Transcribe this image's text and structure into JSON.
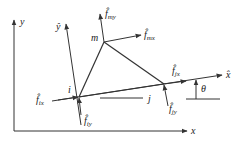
{
  "diagram": {
    "type": "triangular-element-force-diagram",
    "global_axes": {
      "x_label": "x",
      "y_label": "y"
    },
    "local_axes": {
      "x_label": "x̂",
      "y_label": "ŷ"
    },
    "nodes": [
      {
        "id": "i",
        "label": "i"
      },
      {
        "id": "j",
        "label": "j"
      },
      {
        "id": "m",
        "label": "m"
      }
    ],
    "forces": [
      {
        "name": "f_ix",
        "base": "f̂",
        "sub": "ix"
      },
      {
        "name": "f_iy",
        "base": "f̂",
        "sub": "iy"
      },
      {
        "name": "f_jx",
        "base": "f̂",
        "sub": "jx"
      },
      {
        "name": "f_jy",
        "base": "f̂",
        "sub": "jy"
      },
      {
        "name": "f_mx",
        "base": "f̂",
        "sub": "mx"
      },
      {
        "name": "f_my",
        "base": "f̂",
        "sub": "my"
      }
    ],
    "angle_label": "θ",
    "colors": {
      "line": "#333333",
      "text": "#222222",
      "background": "#ffffff"
    }
  }
}
